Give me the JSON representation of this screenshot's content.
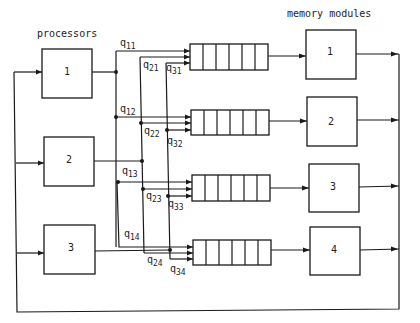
{
  "title_processors": "processors",
  "title_memory": "memory modules",
  "processors": [
    {
      "id": "1",
      "label": "1"
    },
    {
      "id": "2",
      "label": "2"
    },
    {
      "id": "3",
      "label": "3"
    }
  ],
  "memory_modules": [
    {
      "id": "1",
      "label": "1"
    },
    {
      "id": "2",
      "label": "2"
    },
    {
      "id": "3",
      "label": "3"
    },
    {
      "id": "4",
      "label": "4"
    }
  ],
  "queues": [
    {
      "module": "1",
      "cells": 6
    },
    {
      "module": "2",
      "cells": 6
    },
    {
      "module": "3",
      "cells": 6
    },
    {
      "module": "4",
      "cells": 6
    }
  ],
  "edge_labels": {
    "q11": {
      "base": "q",
      "sub": "11"
    },
    "q21": {
      "base": "q",
      "sub": "21"
    },
    "q31": {
      "base": "q",
      "sub": "31"
    },
    "q12": {
      "base": "q",
      "sub": "12"
    },
    "q22": {
      "base": "q",
      "sub": "22"
    },
    "q32": {
      "base": "q",
      "sub": "32"
    },
    "q13": {
      "base": "q",
      "sub": "13"
    },
    "q23": {
      "base": "q",
      "sub": "23"
    },
    "q33": {
      "base": "q",
      "sub": "33"
    },
    "q14": {
      "base": "q",
      "sub": "14"
    },
    "q24": {
      "base": "q",
      "sub": "24"
    },
    "q34": {
      "base": "q",
      "sub": "34"
    }
  }
}
